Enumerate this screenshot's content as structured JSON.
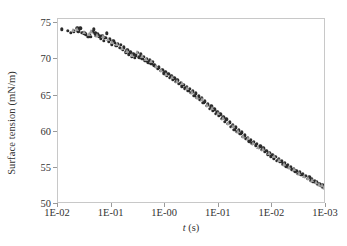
{
  "chart_data": {
    "type": "scatter",
    "title": "",
    "xlabel": "t (s)",
    "ylabel": "Surface tension (mN/m)",
    "x_tick_labels": [
      "1E-02",
      "1E-01",
      "1E-00",
      "1E-01",
      "1E-02",
      "1E-03"
    ],
    "y_tick_labels": [
      "50",
      "55",
      "60",
      "65",
      "70",
      "75"
    ],
    "ylim": [
      50,
      75
    ],
    "y_major_step": 5,
    "x_axis_scale": "log-reversed",
    "x_axis_note": "axis labelled decreasing in time from 1E-02 at left to 1E-03 at right",
    "grid": false,
    "legend": "none",
    "series": [
      {
        "name": "filled-circle-series",
        "marker": "filled-circle",
        "color": "#2b2b2b",
        "points": [
          [
            0.03,
            74.2
          ],
          [
            0.078,
            74.0
          ],
          [
            0.098,
            73.7
          ],
          [
            0.125,
            73.9
          ],
          [
            0.15,
            74.3
          ],
          [
            0.16,
            73.9
          ],
          [
            0.176,
            74.3
          ],
          [
            0.19,
            73.7
          ],
          [
            0.205,
            73.6
          ],
          [
            0.22,
            73.5
          ],
          [
            0.236,
            73.1
          ],
          [
            0.25,
            73.4
          ],
          [
            0.258,
            73.1
          ],
          [
            0.27,
            73.8
          ],
          [
            0.282,
            74.2
          ],
          [
            0.292,
            73.6
          ],
          [
            0.3,
            73.3
          ],
          [
            0.312,
            73.5
          ],
          [
            0.325,
            73.2
          ],
          [
            0.336,
            72.9
          ],
          [
            0.348,
            73.2
          ],
          [
            0.36,
            72.6
          ],
          [
            0.372,
            73.0
          ],
          [
            0.384,
            73.6
          ],
          [
            0.396,
            72.5
          ],
          [
            0.408,
            72.8
          ],
          [
            0.42,
            72.1
          ],
          [
            0.432,
            72.6
          ],
          [
            0.444,
            72.3
          ],
          [
            0.456,
            71.9
          ],
          [
            0.47,
            72.2
          ],
          [
            0.482,
            71.6
          ],
          [
            0.494,
            72.0
          ],
          [
            0.506,
            71.4
          ],
          [
            0.518,
            71.7
          ],
          [
            0.53,
            71.0
          ],
          [
            0.542,
            71.3
          ],
          [
            0.554,
            70.7
          ],
          [
            0.566,
            71.0
          ],
          [
            0.578,
            70.4
          ],
          [
            0.59,
            70.7
          ],
          [
            0.6,
            70.2
          ],
          [
            0.612,
            70.6
          ],
          [
            0.624,
            70.9
          ],
          [
            0.636,
            70.3
          ],
          [
            0.648,
            70.7
          ],
          [
            0.66,
            70.1
          ],
          [
            0.672,
            70.4
          ],
          [
            0.684,
            69.8
          ],
          [
            0.696,
            70.1
          ],
          [
            0.708,
            69.6
          ],
          [
            0.72,
            69.9
          ],
          [
            0.732,
            69.4
          ],
          [
            0.744,
            69.7
          ],
          [
            0.756,
            69.2
          ],
          [
            0.768,
            69.0
          ],
          [
            0.78,
            68.7
          ],
          [
            0.792,
            68.9
          ],
          [
            0.804,
            68.4
          ],
          [
            0.816,
            68.6
          ],
          [
            0.828,
            68.1
          ],
          [
            0.84,
            68.3
          ],
          [
            0.852,
            67.8
          ],
          [
            0.864,
            68.0
          ],
          [
            0.876,
            67.5
          ],
          [
            0.888,
            67.7
          ],
          [
            0.9,
            67.2
          ],
          [
            0.912,
            67.4
          ],
          [
            0.924,
            66.9
          ],
          [
            0.936,
            67.1
          ],
          [
            0.948,
            66.6
          ],
          [
            0.96,
            66.8
          ],
          [
            0.972,
            66.3
          ],
          [
            0.984,
            66.5
          ],
          [
            0.996,
            66.0
          ],
          [
            1.008,
            66.2
          ],
          [
            1.02,
            65.7
          ],
          [
            1.032,
            65.9
          ],
          [
            1.044,
            65.4
          ],
          [
            1.056,
            65.6
          ],
          [
            1.068,
            65.0
          ],
          [
            1.08,
            65.3
          ],
          [
            1.092,
            64.7
          ],
          [
            1.104,
            64.9
          ],
          [
            1.116,
            64.4
          ],
          [
            1.128,
            64.6
          ],
          [
            1.14,
            64.0
          ],
          [
            1.152,
            64.2
          ],
          [
            1.164,
            63.6
          ],
          [
            1.176,
            63.8
          ],
          [
            1.188,
            63.2
          ],
          [
            1.2,
            63.5
          ],
          [
            1.212,
            62.9
          ],
          [
            1.224,
            63.1
          ],
          [
            1.236,
            62.5
          ],
          [
            1.248,
            62.8
          ],
          [
            1.26,
            62.2
          ],
          [
            1.272,
            62.4
          ],
          [
            1.284,
            61.8
          ],
          [
            1.296,
            62.0
          ],
          [
            1.308,
            61.4
          ],
          [
            1.32,
            61.7
          ],
          [
            1.332,
            61.1
          ],
          [
            1.344,
            61.3
          ],
          [
            1.356,
            60.7
          ],
          [
            1.368,
            60.9
          ],
          [
            1.38,
            60.3
          ],
          [
            1.392,
            60.6
          ],
          [
            1.404,
            60.0
          ],
          [
            1.416,
            60.2
          ],
          [
            1.428,
            59.7
          ],
          [
            1.44,
            59.9
          ],
          [
            1.452,
            59.3
          ],
          [
            1.464,
            59.5
          ],
          [
            1.476,
            59.0
          ],
          [
            1.488,
            59.2
          ],
          [
            1.5,
            58.7
          ],
          [
            1.512,
            58.9
          ],
          [
            1.524,
            58.4
          ],
          [
            1.536,
            58.6
          ],
          [
            1.548,
            58.1
          ],
          [
            1.56,
            58.3
          ],
          [
            1.572,
            57.8
          ],
          [
            1.584,
            58.0
          ],
          [
            1.596,
            57.5
          ],
          [
            1.608,
            57.7
          ],
          [
            1.62,
            57.2
          ],
          [
            1.632,
            57.4
          ],
          [
            1.644,
            56.9
          ],
          [
            1.656,
            57.1
          ],
          [
            1.668,
            56.6
          ],
          [
            1.68,
            56.8
          ],
          [
            1.692,
            56.3
          ],
          [
            1.704,
            56.5
          ],
          [
            1.716,
            56.0
          ],
          [
            1.728,
            56.2
          ],
          [
            1.74,
            55.8
          ],
          [
            1.752,
            55.9
          ],
          [
            1.764,
            55.5
          ],
          [
            1.776,
            55.7
          ],
          [
            1.788,
            55.2
          ],
          [
            1.8,
            55.4
          ],
          [
            1.812,
            55.0
          ],
          [
            1.824,
            55.1
          ],
          [
            1.836,
            54.7
          ],
          [
            1.848,
            54.9
          ],
          [
            1.86,
            54.5
          ],
          [
            1.872,
            54.6
          ],
          [
            1.884,
            54.2
          ],
          [
            1.896,
            54.4
          ],
          [
            1.908,
            54.0
          ],
          [
            1.92,
            54.1
          ],
          [
            1.932,
            53.8
          ],
          [
            1.944,
            53.9
          ],
          [
            1.956,
            53.5
          ],
          [
            1.968,
            53.7
          ],
          [
            1.98,
            53.3
          ],
          [
            1.99,
            53.4
          ],
          [
            2.0,
            53.1
          ],
          [
            2.01,
            53.2
          ],
          [
            2.02,
            52.9
          ],
          [
            2.03,
            53.0
          ],
          [
            2.04,
            52.7
          ],
          [
            2.05,
            52.8
          ],
          [
            2.06,
            52.5
          ],
          [
            2.07,
            52.6
          ],
          [
            2.08,
            52.3
          ],
          [
            2.09,
            52.4
          ],
          [
            2.095,
            52.2
          ],
          [
            2.098,
            52.3
          ]
        ]
      },
      {
        "name": "open-triangle-series",
        "marker": "open-triangle",
        "color": "#9d9d9d",
        "points": [
          [
            0.115,
            74.1
          ],
          [
            0.148,
            74.2
          ],
          [
            0.2,
            73.8
          ],
          [
            0.24,
            73.5
          ],
          [
            0.262,
            73.9
          ],
          [
            0.305,
            73.4
          ],
          [
            0.35,
            73.2
          ],
          [
            0.39,
            72.9
          ],
          [
            0.425,
            72.4
          ],
          [
            0.46,
            72.1
          ],
          [
            0.5,
            71.6
          ],
          [
            0.54,
            71.2
          ],
          [
            0.58,
            70.6
          ],
          [
            0.62,
            71.0
          ],
          [
            0.655,
            70.5
          ],
          [
            0.69,
            70.0
          ],
          [
            0.73,
            69.8
          ],
          [
            0.77,
            69.1
          ],
          [
            0.81,
            68.5
          ],
          [
            0.85,
            68.0
          ],
          [
            0.89,
            67.6
          ],
          [
            0.93,
            67.0
          ],
          [
            0.97,
            66.7
          ],
          [
            1.01,
            66.1
          ],
          [
            1.05,
            65.5
          ],
          [
            1.09,
            64.8
          ],
          [
            1.13,
            64.5
          ],
          [
            1.17,
            63.7
          ],
          [
            1.21,
            63.3
          ],
          [
            1.25,
            62.6
          ],
          [
            1.29,
            61.9
          ],
          [
            1.33,
            61.2
          ],
          [
            1.37,
            60.8
          ],
          [
            1.41,
            60.1
          ],
          [
            1.45,
            59.4
          ],
          [
            1.49,
            59.1
          ],
          [
            1.53,
            58.5
          ],
          [
            1.57,
            57.9
          ],
          [
            1.61,
            57.6
          ],
          [
            1.65,
            57.0
          ],
          [
            1.69,
            56.7
          ],
          [
            1.73,
            56.1
          ],
          [
            1.77,
            55.6
          ],
          [
            1.81,
            55.1
          ],
          [
            1.85,
            54.8
          ],
          [
            1.89,
            54.3
          ],
          [
            1.93,
            53.9
          ],
          [
            1.96,
            53.6
          ],
          [
            1.99,
            53.3
          ],
          [
            2.02,
            53.0
          ],
          [
            2.045,
            52.8
          ],
          [
            2.065,
            52.6
          ],
          [
            2.082,
            52.4
          ],
          [
            2.094,
            52.3
          ]
        ]
      }
    ]
  },
  "axes": {
    "x_domain_min": 0.0,
    "x_domain_max": 2.1,
    "y_domain_min": 50,
    "y_domain_max": 75.6
  }
}
